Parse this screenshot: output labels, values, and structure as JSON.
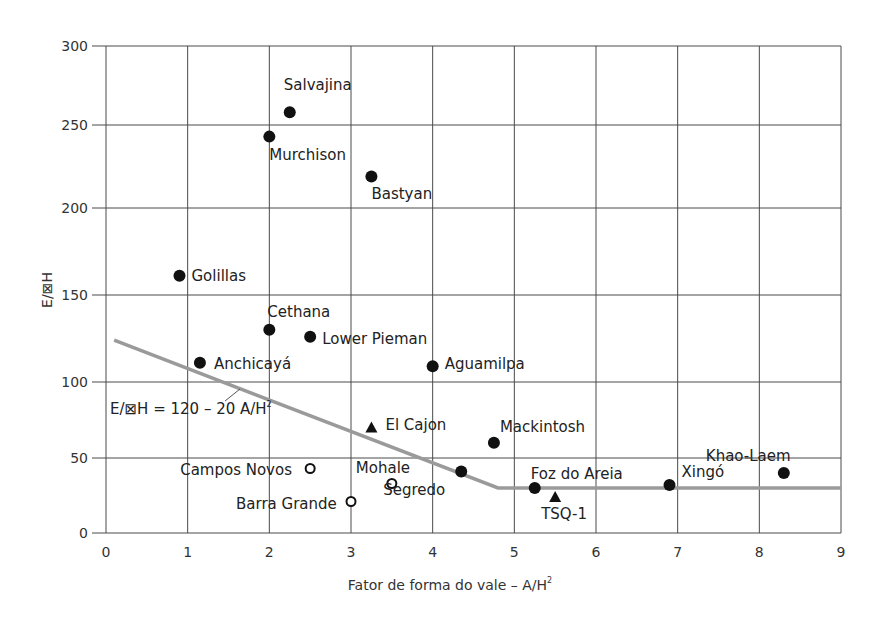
{
  "chart_data": {
    "type": "scatter",
    "title": "",
    "xlabel": "Fator de forma do vale – A/H²",
    "ylabel": "E/ΔH",
    "xlim": [
      0,
      9
    ],
    "ylim": [
      0,
      300
    ],
    "x_ticks": [
      "0",
      "1",
      "2",
      "3",
      "4",
      "5",
      "6",
      "7",
      "8",
      "9"
    ],
    "y_ticks": [
      "0",
      "50",
      "100",
      "150",
      "200",
      "250",
      "300"
    ],
    "grid": true,
    "legend": null,
    "series": [
      {
        "name": "filled-circle",
        "marker": "filled-circle",
        "points": [
          {
            "label": "Salvajina",
            "x": 2.25,
            "y": 258
          },
          {
            "label": "Murchison",
            "x": 2.0,
            "y": 243
          },
          {
            "label": "Bastyan",
            "x": 3.25,
            "y": 219
          },
          {
            "label": "Golillas",
            "x": 0.9,
            "y": 161
          },
          {
            "label": "Cethana",
            "x": 2.0,
            "y": 130
          },
          {
            "label": "Lower Pieman",
            "x": 2.5,
            "y": 126
          },
          {
            "label": "Anchicayá",
            "x": 1.15,
            "y": 111
          },
          {
            "label": "Aguamilpa",
            "x": 4.0,
            "y": 109
          },
          {
            "label": "Mackintosh",
            "x": 4.75,
            "y": 60
          },
          {
            "label": "Segredo",
            "x": 4.35,
            "y": 41
          },
          {
            "label": "Foz do Areia",
            "x": 5.25,
            "y": 30
          },
          {
            "label": "Xingó",
            "x": 6.9,
            "y": 32
          },
          {
            "label": "Khao-Laem",
            "x": 8.3,
            "y": 40
          }
        ]
      },
      {
        "name": "open-circle",
        "marker": "open-circle",
        "points": [
          {
            "label": "Campos Novos",
            "x": 2.5,
            "y": 43
          },
          {
            "label": "Mohale",
            "x": 3.5,
            "y": 33
          },
          {
            "label": "Barra Grande",
            "x": 3.0,
            "y": 21
          }
        ]
      },
      {
        "name": "triangle",
        "marker": "filled-triangle",
        "points": [
          {
            "label": "El Cajon",
            "x": 3.25,
            "y": 70
          },
          {
            "label": "TSQ-1",
            "x": 5.5,
            "y": 24
          }
        ]
      }
    ],
    "reference_line": {
      "label": "E/ΔH = 120 – 20 A/H²",
      "color": "#9a9a9a",
      "points": [
        [
          0.1,
          124
        ],
        [
          4.8,
          30
        ],
        [
          9.0,
          30
        ]
      ]
    }
  },
  "labels": {
    "xlabel_main": "Fator de forma do vale – A/H",
    "xlabel_sup": "2",
    "ylabel": "E/⊠H",
    "eq_main": "E/⊠H = 120 – 20 A/H",
    "eq_sup": "2"
  }
}
